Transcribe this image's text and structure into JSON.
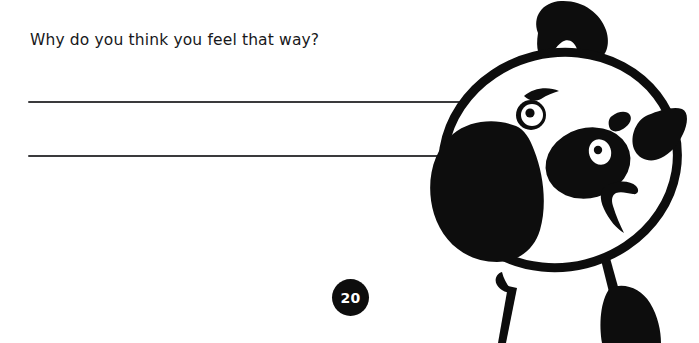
{
  "page": {
    "background_color": "#ffffff",
    "ink_color": "#0d0d0d",
    "rule_color": "#3a3a3c",
    "width": 699,
    "height": 343
  },
  "worksheet": {
    "question": "Why do you think you feel that way?",
    "answer_lines": [
      {
        "id": "answer-line-1",
        "value": "",
        "placeholder": ""
      },
      {
        "id": "answer-line-2",
        "value": "",
        "placeholder": ""
      }
    ]
  },
  "page_number": {
    "label": "20",
    "shape": "circle",
    "fill_color": "#0d0d0d",
    "text_color": "#ffffff"
  },
  "illustration": {
    "name": "cartoon-dog-head",
    "description": "Black-and-white cartoon dog head tilted to the left with hair tuft, floppy ear patch, eye patch, smiling mouth and shoulders",
    "parts": [
      "hair-tuft",
      "head-outline",
      "left-ear-patch",
      "right-ear",
      "left-eye",
      "left-eyebrow",
      "right-eye-patch",
      "right-eye",
      "nose",
      "mouth",
      "neck",
      "left-arm",
      "right-arm"
    ]
  }
}
